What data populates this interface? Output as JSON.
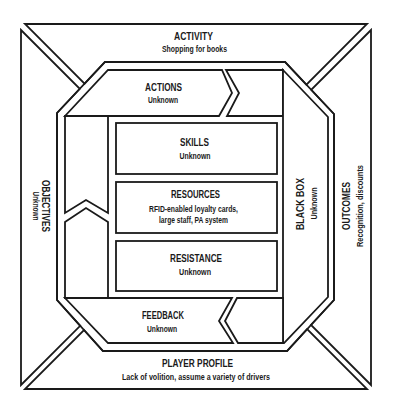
{
  "diagram": {
    "colors": {
      "background": "#ffffff",
      "line": "#1a1a1a"
    },
    "activity": {
      "title": "ACTIVITY",
      "value": "Shopping for books"
    },
    "objectives": {
      "title": "OBJECTIVES",
      "value": "Unknown"
    },
    "outcomes": {
      "title": "OUTCOMES",
      "value": "Recognition, discounts"
    },
    "player_profile": {
      "title": "PLAYER PROFILE",
      "value": "Lack of volition, assume a variety of drivers"
    },
    "actions": {
      "title": "ACTIONS",
      "value": "Unknown"
    },
    "feedback": {
      "title": "FEEDBACK",
      "value": "Unknown"
    },
    "black_box": {
      "title": "BLACK BOX",
      "value": "Unknown"
    },
    "skills": {
      "title": "SKILLS",
      "value": "Unknown"
    },
    "resources": {
      "title": "RESOURCES",
      "value_lines": [
        "RFID-enabled loyalty cards,",
        "large staff, PA system"
      ]
    },
    "resistance": {
      "title": "RESISTANCE",
      "value": "Unknown"
    }
  }
}
